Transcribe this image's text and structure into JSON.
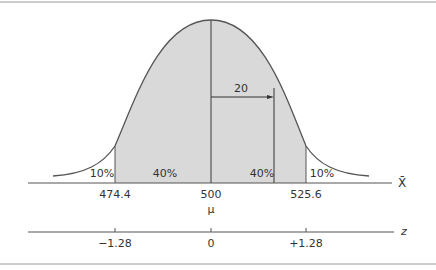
{
  "diagram": {
    "type": "normal-distribution",
    "mean_label": "500",
    "mu_symbol": "μ",
    "offset_label": "20",
    "x_axis_label": "X̄",
    "z_axis_label": "z",
    "x_ticks": [
      "474.4",
      "500",
      "525.6"
    ],
    "z_ticks": [
      "−1.28",
      "0",
      "+1.28"
    ],
    "regions": [
      {
        "label": "10%",
        "position": "left-tail"
      },
      {
        "label": "40%",
        "position": "left-center"
      },
      {
        "label": "40%",
        "position": "right-center"
      },
      {
        "label": "10%",
        "position": "right-tail"
      }
    ],
    "colors": {
      "shade": "#d9d9d9",
      "line": "#555555",
      "border": "#999999"
    }
  }
}
